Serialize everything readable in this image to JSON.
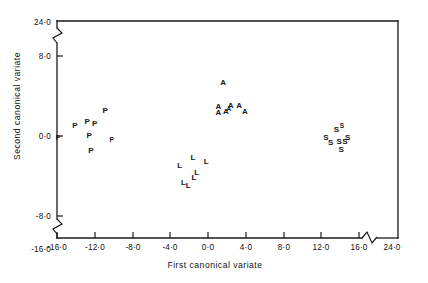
{
  "figure": {
    "kind": "scatter-plot",
    "background": "#ffffff",
    "ink_color": "#161616"
  },
  "chart_data": {
    "type": "scatter",
    "title": "",
    "subtitle": "",
    "xlabel": "First canonical variate",
    "ylabel": "Second canonical variate",
    "xlim": [
      -16.0,
      24.0
    ],
    "ylim": [
      -16.0,
      24.0
    ],
    "grid": false,
    "legend_position": "none",
    "axis_breaks": {
      "x": {
        "between": [
          16.0,
          24.0
        ],
        "style": "zigzag"
      },
      "y": {
        "between": [
          8.0,
          24.0
        ],
        "style": "zigzag"
      },
      "y_lower": {
        "between": [
          -16.0,
          -8.0
        ],
        "style": "zigzag"
      }
    },
    "xticks": [
      -16.0,
      -12.0,
      -8.0,
      -4.0,
      0.0,
      4.0,
      8.0,
      12.0,
      16.0,
      24.0
    ],
    "xticklabels": [
      "-16·0",
      "-12·0",
      "-8·0",
      "-4·0",
      "0·0",
      "4·0",
      "8·0",
      "12·0",
      "16·0",
      "24·0"
    ],
    "yticks": [
      24.0,
      8.0,
      0.0,
      -8.0,
      -16.0
    ],
    "yticklabels": [
      "24·0",
      "8·0",
      "0·0",
      "-8·0",
      "-16·0"
    ],
    "series": [
      {
        "name": "P",
        "marker": "P",
        "points": [
          {
            "x": -15.9,
            "y": -0.1,
            "size": "small"
          },
          {
            "x": -14.1,
            "y": 1.1,
            "size": "normal"
          },
          {
            "x": -12.8,
            "y": 1.5,
            "size": "normal"
          },
          {
            "x": -12.0,
            "y": 1.3,
            "size": "normal"
          },
          {
            "x": -12.6,
            "y": 0.1,
            "size": "normal"
          },
          {
            "x": -10.9,
            "y": 2.6,
            "size": "normal"
          },
          {
            "x": -10.2,
            "y": -0.3,
            "size": "small"
          },
          {
            "x": -12.4,
            "y": -1.4,
            "size": "normal"
          }
        ]
      },
      {
        "name": "L",
        "marker": "L",
        "points": [
          {
            "x": -3.0,
            "y": -2.9,
            "size": "normal"
          },
          {
            "x": -1.6,
            "y": -2.1,
            "size": "normal"
          },
          {
            "x": -0.2,
            "y": -2.5,
            "size": "normal"
          },
          {
            "x": -1.2,
            "y": -3.6,
            "size": "normal"
          },
          {
            "x": -1.5,
            "y": -4.1,
            "size": "normal"
          },
          {
            "x": -2.6,
            "y": -4.6,
            "size": "normal"
          },
          {
            "x": -2.1,
            "y": -4.9,
            "size": "normal"
          }
        ]
      },
      {
        "name": "A",
        "marker": "A",
        "points": [
          {
            "x": 1.6,
            "y": 5.4,
            "size": "normal"
          },
          {
            "x": 1.1,
            "y": 3.0,
            "size": "normal"
          },
          {
            "x": 1.9,
            "y": 2.5,
            "size": "normal"
          },
          {
            "x": 1.1,
            "y": 2.4,
            "size": "normal"
          },
          {
            "x": 2.4,
            "y": 3.1,
            "size": "normal"
          },
          {
            "x": 3.3,
            "y": 3.1,
            "size": "normal"
          },
          {
            "x": 3.9,
            "y": 2.5,
            "size": "normal"
          },
          {
            "x": 2.2,
            "y": 2.8,
            "size": "small"
          }
        ]
      },
      {
        "name": "S",
        "marker": "S",
        "points": [
          {
            "x": 13.6,
            "y": 0.7,
            "size": "normal"
          },
          {
            "x": 12.5,
            "y": -0.1,
            "size": "normal"
          },
          {
            "x": 13.0,
            "y": -0.6,
            "size": "normal"
          },
          {
            "x": 13.9,
            "y": -0.5,
            "size": "normal"
          },
          {
            "x": 14.5,
            "y": -0.5,
            "size": "normal"
          },
          {
            "x": 14.8,
            "y": -0.1,
            "size": "normal"
          },
          {
            "x": 14.2,
            "y": 1.1,
            "size": "small"
          },
          {
            "x": 14.1,
            "y": -1.3,
            "size": "normal"
          }
        ]
      }
    ]
  }
}
